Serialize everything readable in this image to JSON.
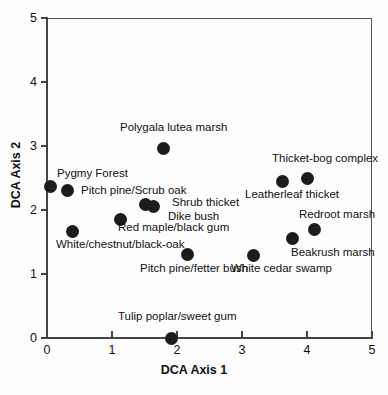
{
  "chart_data": {
    "type": "scatter",
    "title": "",
    "xlabel": "DCA Axis 1",
    "ylabel": "DCA Axis 2",
    "xlim": [
      0,
      5
    ],
    "ylim": [
      0,
      5
    ],
    "xticks": [
      "0",
      "1",
      "2",
      "3",
      "4",
      "5"
    ],
    "yticks": [
      "0",
      "1",
      "2",
      "3",
      "4",
      "5"
    ],
    "grid": false,
    "legend": "none",
    "marker_color": "#1c1c1c",
    "points": [
      {
        "label": "Pygmy Forest",
        "x": 0.05,
        "y": 2.36,
        "label_x": 57,
        "label_y": 167
      },
      {
        "label": "Pitch pine/Scrub oak",
        "x": 0.32,
        "y": 2.31,
        "label_x": 81,
        "label_y": 184
      },
      {
        "label": "White/chestnut/black-oak",
        "x": 0.39,
        "y": 1.67,
        "label_x": 56,
        "label_y": 238
      },
      {
        "label": "Polygala lutea marsh",
        "x": 1.79,
        "y": 2.96,
        "label_x": 120,
        "label_y": 121
      },
      {
        "label": "Red maple/black gum",
        "x": 1.13,
        "y": 1.85,
        "label_x": 118,
        "label_y": 221
      },
      {
        "label": "Shrub thicket",
        "x": 1.51,
        "y": 2.09,
        "label_x": 172,
        "label_y": 196
      },
      {
        "label": "Dike bush",
        "x": 1.64,
        "y": 2.05,
        "label_x": 168,
        "label_y": 210
      },
      {
        "label": "Pitch pine/fetter bush",
        "x": 2.16,
        "y": 1.31,
        "label_x": 140,
        "label_y": 262
      },
      {
        "label": "Tulip poplar/sweet gum",
        "x": 1.92,
        "y": 0.0,
        "label_x": 118,
        "label_y": 310
      },
      {
        "label": "White cedar swamp",
        "x": 3.18,
        "y": 1.29,
        "label_x": 231,
        "label_y": 262
      },
      {
        "label": "Leatherleaf thicket",
        "x": 3.63,
        "y": 2.45,
        "label_x": 245,
        "label_y": 188
      },
      {
        "label": "Thicket-bog complex",
        "x": 4.0,
        "y": 2.49,
        "label_x": 272,
        "label_y": 152
      },
      {
        "label": "Beakrush marsh",
        "x": 3.78,
        "y": 1.56,
        "label_x": 291,
        "label_y": 246
      },
      {
        "label": "Redroot marsh",
        "x": 4.11,
        "y": 1.7,
        "label_x": 299,
        "label_y": 208
      }
    ]
  },
  "axes": {
    "x_title": "DCA Axis 1",
    "y_title": "DCA Axis 2"
  }
}
